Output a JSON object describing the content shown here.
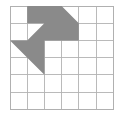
{
  "figure": {
    "type": "grid-shape-figure",
    "background_color": "#ffffff"
  },
  "grid": {
    "name": "square-lattice",
    "columns": 6,
    "rows": 6,
    "origin_x": 10,
    "origin_y": 6,
    "cell_size": 17.2,
    "line_color": "#b3b3b3",
    "line_width": 0.9,
    "border_color": "#b0b0b0",
    "border_width": 1.0
  },
  "shape": {
    "name": "gray-arrow-polygon",
    "fill_color": "#8a8a8a",
    "stroke": "none",
    "description": "Right-pointing arrow with tail, drawn on lattice points",
    "lattice_points": [
      [
        1,
        0
      ],
      [
        3,
        0
      ],
      [
        4,
        1
      ],
      [
        4,
        2
      ],
      [
        2,
        2
      ],
      [
        2,
        4
      ],
      [
        0,
        2
      ],
      [
        1,
        2
      ],
      [
        2,
        1
      ],
      [
        1,
        1
      ]
    ],
    "polygon_points_grid": "1,0 3,0 4,1 4,2 2,2 2,4 0,2 1,2 2,1 1,1"
  },
  "chart_data": {
    "type": "table",
    "xlabel": "column",
    "ylabel": "row",
    "xlim": [
      0,
      6
    ],
    "ylim": [
      0,
      6
    ],
    "grid": true,
    "categories": [
      "columns",
      "rows"
    ],
    "values": [
      6,
      6
    ],
    "annotations": [
      "6 by 6 square grid",
      "One shaded gray arrow polygon in the upper-left quadrant",
      "Arrow head points to the right, tail extends down-left"
    ]
  }
}
